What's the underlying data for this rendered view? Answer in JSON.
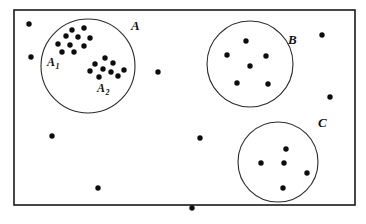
{
  "figure": {
    "frame": {
      "x": 14,
      "y": 10,
      "width": 341,
      "height": 195
    },
    "colors": {
      "point": "#0d0d0d",
      "circle_stroke": "#2b2b2b",
      "frame_stroke": "#1a1a1a",
      "background": "#ffffff",
      "label_color": "#111111"
    },
    "point_radius": 2.7
  },
  "chart_data": {
    "type": "scatter",
    "title": "",
    "xlabel": "",
    "ylabel": "",
    "grid": false,
    "legend": "none",
    "axes_visible": false,
    "xlim": [
      14,
      355
    ],
    "ylim": [
      10,
      205
    ],
    "clusters": [
      {
        "name": "A",
        "label": "A",
        "label_subscript": "",
        "label_x": 131,
        "label_y": 30,
        "circle": {
          "cx": 88,
          "cy": 66,
          "r": 47
        },
        "point_count": 19,
        "subclusters": [
          "A1",
          "A2"
        ]
      },
      {
        "name": "A1",
        "label": "A",
        "label_subscript": "1",
        "label_x": 47,
        "label_y": 66,
        "circle": null,
        "point_count": 10,
        "points": [
          [
            72,
            30
          ],
          [
            84,
            28
          ],
          [
            66,
            36
          ],
          [
            78,
            37
          ],
          [
            90,
            38
          ],
          [
            58,
            44
          ],
          [
            70,
            45
          ],
          [
            84,
            46
          ],
          [
            62,
            52
          ],
          [
            74,
            52
          ]
        ]
      },
      {
        "name": "A2",
        "label": "A",
        "label_subscript": "2",
        "label_x": 97,
        "label_y": 92,
        "circle": null,
        "point_count": 9,
        "points": [
          [
            105,
            58
          ],
          [
            95,
            64
          ],
          [
            113,
            63
          ],
          [
            103,
            69
          ],
          [
            90,
            71
          ],
          [
            111,
            72
          ],
          [
            99,
            77
          ],
          [
            118,
            76
          ],
          [
            124,
            70
          ]
        ]
      },
      {
        "name": "B",
        "label": "B",
        "label_subscript": "",
        "label_x": 288,
        "label_y": 44,
        "circle": {
          "cx": 250,
          "cy": 64,
          "r": 43
        },
        "point_count": 6,
        "points": [
          [
            246,
            41
          ],
          [
            227,
            55
          ],
          [
            266,
            56
          ],
          [
            250,
            66
          ],
          [
            237,
            83
          ],
          [
            268,
            84
          ]
        ]
      },
      {
        "name": "C",
        "label": "C",
        "label_subscript": "",
        "label_x": 318,
        "label_y": 127,
        "circle": {
          "cx": 278,
          "cy": 162,
          "r": 40
        },
        "point_count": 5,
        "points": [
          [
            286,
            149
          ],
          [
            261,
            163
          ],
          [
            284,
            163
          ],
          [
            307,
            173
          ],
          [
            283,
            188
          ]
        ]
      }
    ],
    "outliers": {
      "name": "unclustered-points",
      "point_count": 8,
      "points": [
        [
          29,
          24
        ],
        [
          31,
          57
        ],
        [
          158,
          72
        ],
        [
          200,
          138
        ],
        [
          322,
          35
        ],
        [
          330,
          97
        ],
        [
          52,
          136
        ],
        [
          98,
          188
        ],
        [
          192,
          208
        ]
      ]
    }
  }
}
